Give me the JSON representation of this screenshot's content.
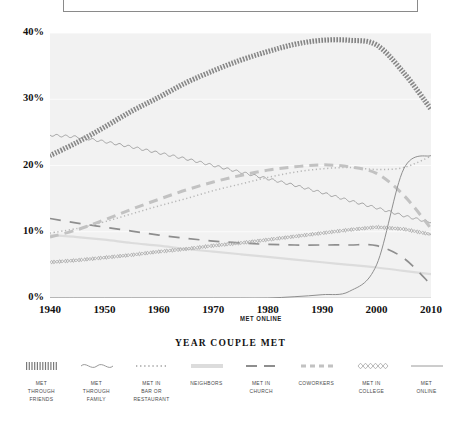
{
  "top_frame": {
    "label": ""
  },
  "axes": {
    "y_title": "PERCENTAGE WHO MET THIS WAY",
    "x_title": "YEAR COUPLE MET",
    "y_ticks": [
      "0%",
      "10%",
      "20%",
      "30%",
      "40%"
    ],
    "x_ticks": [
      "1940",
      "1950",
      "1960",
      "1970",
      "1980",
      "1990",
      "2000",
      "2010"
    ]
  },
  "annotations": [
    {
      "name": "met-online-annotation",
      "text": "MET ONLINE"
    }
  ],
  "legend": {
    "items": [
      {
        "label": "MET\nTHROUGH\nFRIENDS",
        "style": "hatched",
        "color": "#7a7a7a"
      },
      {
        "label": "MET\nTHROUGH\nFAMILY",
        "style": "wavy",
        "color": "#9a9a9a"
      },
      {
        "label": "MET IN\nBAR OR\nRESTAURANT",
        "style": "dotted",
        "color": "#b6b6b6"
      },
      {
        "label": "NEIGHBORS",
        "style": "faint",
        "color": "#dcdcdc"
      },
      {
        "label": "MET IN\nCHURCH",
        "style": "longdash",
        "color": "#8e8e8e"
      },
      {
        "label": "COWORKERS",
        "style": "dashed",
        "color": "#c2c2c2"
      },
      {
        "label": "MET IN\nCOLLEGE",
        "style": "diamond",
        "color": "#a6a6a6"
      },
      {
        "label": "MET\nONLINE",
        "style": "solid",
        "color": "#8f8f8f"
      }
    ]
  },
  "chart_data": {
    "type": "line",
    "title": "",
    "subtitle": "",
    "xlabel": "YEAR COUPLE MET",
    "ylabel": "PERCENTAGE WHO MET THIS WAY",
    "xlim": [
      1940,
      2010
    ],
    "ylim": [
      0,
      40
    ],
    "yunit": "%",
    "grid": true,
    "legend_position": "bottom",
    "x": [
      1940,
      1945,
      1950,
      1955,
      1960,
      1965,
      1970,
      1975,
      1980,
      1985,
      1990,
      1995,
      2000,
      2005,
      2010
    ],
    "series": [
      {
        "name": "MET THROUGH FRIENDS",
        "style": "hatched",
        "color": "#7a7a7a",
        "values": [
          21.5,
          23.5,
          25.8,
          28.2,
          30.3,
          32.5,
          34.3,
          35.9,
          37.2,
          38.3,
          38.9,
          38.9,
          38.2,
          34.0,
          28.5
        ]
      },
      {
        "name": "MET THROUGH FAMILY",
        "style": "wavy",
        "color": "#9a9a9a",
        "values": [
          24.6,
          24.3,
          23.6,
          22.8,
          21.9,
          21.0,
          20.0,
          19.0,
          18.0,
          17.0,
          15.9,
          14.7,
          13.6,
          12.4,
          11.4
        ]
      },
      {
        "name": "MET IN BAR OR RESTAURANT",
        "style": "dotted",
        "color": "#b6b6b6",
        "values": [
          9.8,
          10.5,
          11.5,
          12.7,
          13.9,
          15.0,
          16.2,
          17.2,
          18.2,
          19.0,
          19.5,
          19.7,
          19.4,
          19.7,
          21.4
        ]
      },
      {
        "name": "NEIGHBORS",
        "style": "faint",
        "color": "#dcdcdc",
        "values": [
          9.5,
          9.2,
          8.8,
          8.3,
          7.9,
          7.4,
          7.0,
          6.6,
          6.2,
          5.8,
          5.4,
          5.0,
          4.6,
          4.1,
          3.6
        ]
      },
      {
        "name": "MET IN CHURCH",
        "style": "longdash",
        "color": "#8e8e8e",
        "values": [
          12.0,
          11.3,
          10.7,
          10.1,
          9.5,
          9.0,
          8.6,
          8.3,
          8.1,
          8.0,
          8.0,
          8.0,
          7.9,
          6.0,
          2.0
        ]
      },
      {
        "name": "COWORKERS",
        "style": "dashed",
        "color": "#c2c2c2",
        "values": [
          9.2,
          10.3,
          11.8,
          13.4,
          14.9,
          16.3,
          17.5,
          18.5,
          19.3,
          19.8,
          20.1,
          19.8,
          18.8,
          15.5,
          10.5
        ]
      },
      {
        "name": "MET IN COLLEGE",
        "style": "diamond",
        "color": "#a6a6a6",
        "values": [
          5.4,
          5.7,
          6.1,
          6.5,
          7.0,
          7.4,
          7.9,
          8.3,
          8.8,
          9.3,
          9.8,
          10.3,
          10.7,
          10.4,
          9.6
        ]
      },
      {
        "name": "MET ONLINE",
        "style": "solid",
        "color": "#8f8f8f",
        "values": [
          0.0,
          0.0,
          0.0,
          0.0,
          0.0,
          0.0,
          0.0,
          0.0,
          0.0,
          0.2,
          0.5,
          1.0,
          5.0,
          19.5,
          21.5
        ]
      }
    ]
  }
}
